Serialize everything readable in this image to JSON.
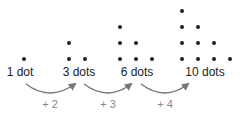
{
  "diagram": {
    "groups": [
      {
        "label": "1 dot",
        "count": 1,
        "label_x": 20,
        "dots": [
          [
            24,
            59
          ]
        ]
      },
      {
        "label": "3 dots",
        "count": 3,
        "label_x": 79,
        "dots": [
          [
            69,
            43
          ],
          [
            69,
            59
          ],
          [
            85,
            59
          ]
        ]
      },
      {
        "label": "6 dots",
        "count": 6,
        "label_x": 137,
        "dots": [
          [
            120,
            27
          ],
          [
            120,
            43
          ],
          [
            136,
            43
          ],
          [
            120,
            59
          ],
          [
            136,
            59
          ],
          [
            152,
            59
          ]
        ]
      },
      {
        "label": "10 dots",
        "count": 10,
        "label_x": 205,
        "dots": [
          [
            182,
            11
          ],
          [
            182,
            27
          ],
          [
            198,
            27
          ],
          [
            182,
            43
          ],
          [
            198,
            43
          ],
          [
            214,
            43
          ],
          [
            182,
            59
          ],
          [
            198,
            59
          ],
          [
            214,
            59
          ],
          [
            230,
            59
          ]
        ]
      }
    ],
    "steps": [
      {
        "label": "+ 2",
        "x": 50
      },
      {
        "label": "+ 3",
        "x": 108
      },
      {
        "label": "+ 4",
        "x": 165
      }
    ],
    "colors": {
      "dot": "#222222",
      "arrow": "#777777",
      "step_text": "#888888"
    }
  }
}
